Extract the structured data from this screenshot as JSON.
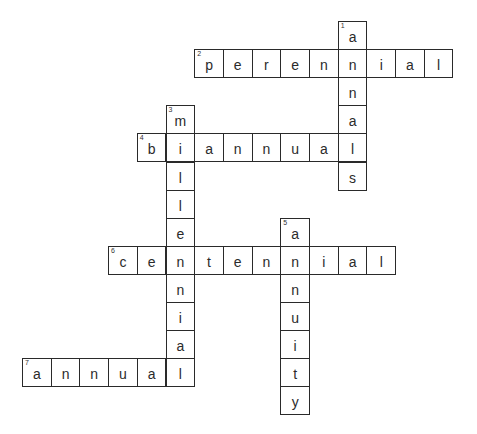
{
  "puzzle": {
    "type": "crossword",
    "cell_w": 28.7,
    "cell_h": 28.1,
    "origin_x": 22,
    "origin_y": 21,
    "entries": [
      {
        "number": "1",
        "direction": "down",
        "answer": "annals",
        "col": 11,
        "row": 0
      },
      {
        "number": "2",
        "direction": "across",
        "answer": "perennial",
        "col": 6,
        "row": 1
      },
      {
        "number": "3",
        "direction": "down",
        "answer": "millennial",
        "col": 5,
        "row": 3
      },
      {
        "number": "4",
        "direction": "across",
        "answer": "biannual",
        "col": 4,
        "row": 4
      },
      {
        "number": "5",
        "direction": "down",
        "answer": "annuity",
        "col": 9,
        "row": 7
      },
      {
        "number": "6",
        "direction": "across",
        "answer": "centennial",
        "col": 3,
        "row": 8
      },
      {
        "number": "7",
        "direction": "across",
        "answer": "annual",
        "col": 0,
        "row": 12
      }
    ]
  },
  "colors": {
    "border": "#2a2a2a",
    "letter": "#2b2b2b",
    "background": "#ffffff"
  }
}
